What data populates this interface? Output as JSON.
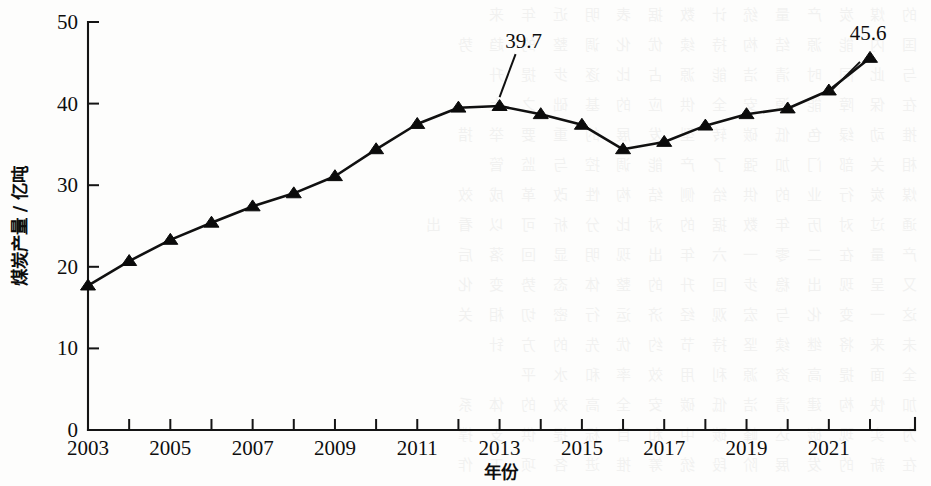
{
  "chart_data": {
    "type": "line",
    "title": "",
    "xlabel": "年份",
    "ylabel": "煤炭产量 / 亿吨",
    "xlim": [
      2003,
      2022
    ],
    "ylim": [
      0,
      50
    ],
    "grid": false,
    "legend": null,
    "x": [
      2003,
      2004,
      2005,
      2006,
      2007,
      2008,
      2009,
      2010,
      2011,
      2012,
      2013,
      2014,
      2015,
      2016,
      2017,
      2018,
      2019,
      2020,
      2021,
      2022
    ],
    "values": [
      17.7,
      20.7,
      23.3,
      25.4,
      27.4,
      29.0,
      31.1,
      34.4,
      37.5,
      39.5,
      39.7,
      38.7,
      37.4,
      34.4,
      35.3,
      37.3,
      38.7,
      39.4,
      41.6,
      45.6
    ],
    "x_tick_labels": [
      "2003",
      "2005",
      "2007",
      "2009",
      "2011",
      "2013",
      "2015",
      "2017",
      "2019",
      "2021"
    ],
    "x_tick_values": [
      2003,
      2005,
      2007,
      2009,
      2011,
      2013,
      2015,
      2017,
      2019,
      2021
    ],
    "y_tick_labels": [
      "0",
      "10",
      "20",
      "30",
      "40",
      "50"
    ],
    "y_tick_values": [
      0,
      10,
      20,
      30,
      40,
      50
    ],
    "annotations": [
      {
        "label": "39.7",
        "x": 2013,
        "y": 39.7
      },
      {
        "label": "45.6",
        "x": 2022,
        "y": 45.6
      }
    ],
    "marker": "triangle",
    "line_color": "#101010",
    "marker_color": "#0b0b0b"
  },
  "background_bleed": [
    "的 煤 炭 产 量 统 计 数 据 表 明 近 年 来",
    "国 内 能 源 结 构 持 续 优 化 调 整 的 趋 势",
    "与 此 同 时 清 洁 能 源 占 比 逐 步 提 升",
    "在 保 障 能 源 安 全 供 应 的 基 础 之 上",
    "推 动 绿 色 低 碳 转 型 发 展 的 重 要 举 措",
    "相 关 部 门 加 强 了 产 能 调 控 与 监 管",
    "煤 炭 行 业 的 供 给 侧 结 构 性 改 革 成 效",
    "通 过 对 历 年 数 据 的 对 比 分 析 可 以 看 出",
    "产 量 在 二 零 一 六 年 出 现 明 显 回 落 后",
    "又 呈 现 出 稳 步 回 升 的 整 体 态 势 变 化",
    "这 一 变 化 与 宏 观 经 济 运 行 密 切 相 关",
    "未 来 将 继 续 坚 持 节 约 优 先 的 方 针",
    "全 面 提 高 资 源 利 用 效 率 和 水 平",
    "加 快 构 建 清 洁 低 碳 安 全 高 效 的 体 系",
    "为 实 现 碳 达 峰 碳 中 和 目 标 提 供 支 撑",
    "在 新 的 发 展 阶 段 统 筹 推 进 各 项 工 作"
  ]
}
